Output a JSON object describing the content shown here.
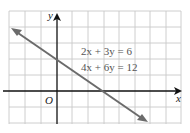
{
  "figure": {
    "equations": [
      "2x + 3y = 6",
      "4x + 6y = 12"
    ],
    "axis_labels": {
      "x": "x",
      "y": "y",
      "origin": "O"
    },
    "grid": {
      "x_min": -3,
      "x_max": 8,
      "y_min": -2,
      "y_max": 5,
      "cell_px": 15.6
    },
    "line": {
      "description": "single line representing both equations",
      "y_intercept": 2,
      "x_intercept": 3,
      "slope": -0.6667
    },
    "colors": {
      "grid": "#c8c8c8",
      "axes": "#111111",
      "line": "#6b6b6b",
      "text": "#555555"
    }
  }
}
